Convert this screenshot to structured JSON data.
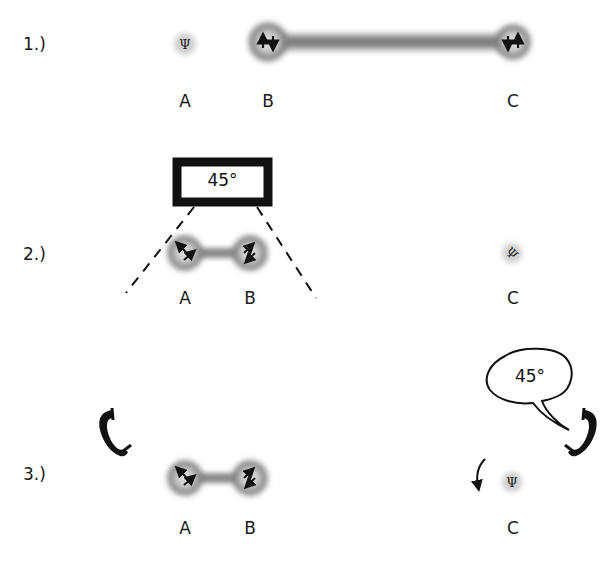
{
  "rows": [
    {
      "label": "1.)",
      "nodes": [
        {
          "label": "A",
          "state": "psi",
          "symbol": "Ψ"
        },
        {
          "label": "B",
          "state": "spin-up-down",
          "symbol": "↑↓"
        },
        {
          "label": "C",
          "state": "spin-down-up",
          "symbol": "↓↑"
        }
      ],
      "link": "B-C entangled (long bond)"
    },
    {
      "label": "2.)",
      "nodes": [
        {
          "label": "A",
          "state": "diagonal-antiparallel",
          "symbol": "⤡"
        },
        {
          "label": "B",
          "state": "diagonal-antiparallel",
          "symbol": "⤢"
        },
        {
          "label": "C",
          "state": "psi-rotated",
          "symbol": "Ψ"
        }
      ],
      "measurement_box": {
        "text": "45°"
      },
      "link": "A-B entangled (short bond)"
    },
    {
      "label": "3.)",
      "nodes": [
        {
          "label": "A",
          "state": "diagonal-antiparallel",
          "symbol": "⤡"
        },
        {
          "label": "B",
          "state": "diagonal-antiparallel",
          "symbol": "⤢"
        },
        {
          "label": "C",
          "state": "psi",
          "symbol": "Ψ"
        }
      ],
      "speech_bubble": {
        "text": "45°"
      },
      "icons": [
        "phone-left-icon",
        "phone-right-icon",
        "rotate-arrow-icon"
      ],
      "link": "A-B entangled (short bond)"
    }
  ],
  "colors": {
    "background": "#ffffff",
    "ink": "#111111",
    "cloud_dark": "#6e6e6e",
    "cloud_light": "#c8c8c8"
  }
}
